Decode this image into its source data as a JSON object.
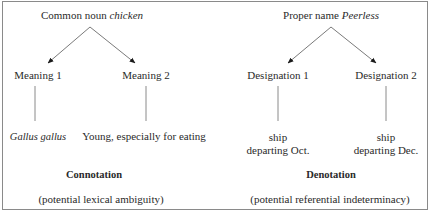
{
  "left_tree": {
    "root_prefix": "Common noun ",
    "root_term": "chicken",
    "branch_1": "Meaning 1",
    "branch_2": "Meaning 2",
    "leaf_1": "Gallus gallus",
    "leaf_2": "Young, especially for eating",
    "category": "Connotation",
    "note": "(potential lexical ambiguity)"
  },
  "right_tree": {
    "root_prefix": "Proper name ",
    "root_term": "Peerless",
    "branch_1": "Designation 1",
    "branch_2": "Designation 2",
    "leaf_1_line1": "ship",
    "leaf_1_line2": "departing Oct.",
    "leaf_2_line1": "ship",
    "leaf_2_line2": "departing Dec.",
    "category": "Denotation",
    "note": "(potential referential indeterminacy)"
  },
  "colors": {
    "line": "#7a7a7a",
    "arrowhead": "#1a1a1a",
    "border": "#8a8a8a",
    "text": "#2a2a2a"
  }
}
